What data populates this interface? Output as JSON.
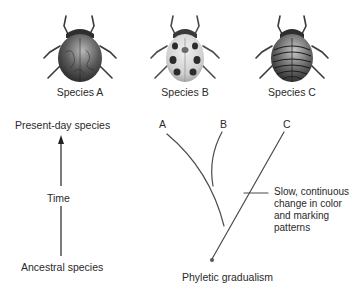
{
  "species": [
    {
      "id": "A",
      "label": "Species A",
      "pattern": "marbled-dark"
    },
    {
      "id": "B",
      "label": "Species B",
      "pattern": "spotted-light"
    },
    {
      "id": "C",
      "label": "Species C",
      "pattern": "striped-dark"
    }
  ],
  "timeline": {
    "top_label": "Present-day species",
    "middle_label": "Time",
    "bottom_label": "Ancestral species",
    "arrow_icon": "arrow-up-icon"
  },
  "tree": {
    "branch_labels": [
      "A",
      "B",
      "C"
    ],
    "annotation_lines": [
      "Slow, continuous",
      "change in color",
      "and marking",
      "patterns"
    ],
    "caption": "Phyletic gradualism"
  },
  "colors": {
    "line": "#4a4a4a",
    "text": "#2a2a2a",
    "beetle_dark": "#3a3a3a",
    "beetle_mid": "#8a8a8a",
    "beetle_light": "#d8d8d8"
  }
}
